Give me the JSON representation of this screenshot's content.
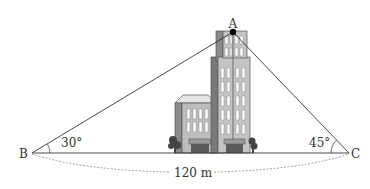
{
  "figure": {
    "points": {
      "A": {
        "label": "A",
        "x": 233,
        "y": 32
      },
      "B": {
        "label": "B",
        "x": 32,
        "y": 153
      },
      "C": {
        "label": "C",
        "x": 349,
        "y": 153
      }
    },
    "angles": {
      "B": {
        "label": "30°",
        "value": 30
      },
      "C": {
        "label": "45°",
        "value": 45
      }
    },
    "distance": {
      "label": "120 m",
      "value": 120,
      "unit": "m"
    },
    "colors": {
      "line": "#333333",
      "dashed": "#888888",
      "building_light": "#d9d9d9",
      "building_mid": "#b0b0b0",
      "building_dark": "#6e6e6e",
      "window": "#ffffff",
      "tree": "#444444"
    }
  }
}
